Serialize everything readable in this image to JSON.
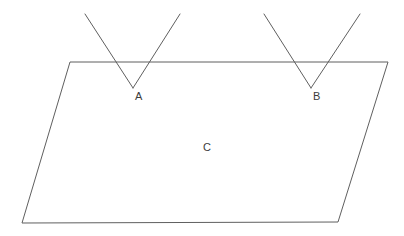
{
  "figure": {
    "background_color": "#ffffff",
    "stroke_color": "#5f5f5f",
    "label_color": "#3c3c3c",
    "stroke_width": 1,
    "canvas": {
      "width": 404,
      "height": 236
    }
  },
  "labels": {
    "angle_a": "A",
    "angle_b": "B",
    "plane_c": "C"
  },
  "geometry": {
    "plane": {
      "name": "plane-C",
      "shape": "parallelogram",
      "points": "70,62 388,62 338,222 22,223",
      "vertices": [
        {
          "name": "top-left",
          "x": 70,
          "y": 62
        },
        {
          "name": "top-right",
          "x": 388,
          "y": 62
        },
        {
          "name": "bottom-right",
          "x": 338,
          "y": 222
        },
        {
          "name": "bottom-left",
          "x": 22,
          "y": 223
        }
      ]
    },
    "angle_a": {
      "name": "angle-A",
      "vertex": {
        "x": 133,
        "y": 88
      },
      "left_arm_end": {
        "x": 85,
        "y": 14
      },
      "right_arm_end": {
        "x": 180,
        "y": 14
      },
      "left_arm_path": "85,14 133,88",
      "right_arm_path": "133,88 180,14",
      "top_edge_crossings": [
        113,
        153
      ]
    },
    "angle_b": {
      "name": "angle-B",
      "vertex": {
        "x": 311,
        "y": 88
      },
      "left_arm_end": {
        "x": 264,
        "y": 14
      },
      "right_arm_end": {
        "x": 360,
        "y": 14
      },
      "left_arm_path": "264,14 311,88",
      "right_arm_path": "311,88 360,14",
      "top_edge_crossings": [
        292,
        332
      ]
    }
  },
  "label_positions": {
    "angle_a": {
      "x": 135,
      "y": 91
    },
    "angle_b": {
      "x": 313,
      "y": 91
    },
    "plane_c": {
      "x": 203,
      "y": 142
    }
  }
}
